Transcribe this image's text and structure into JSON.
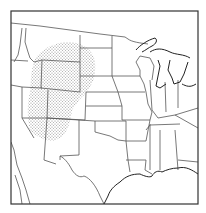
{
  "map": {
    "type": "range-map",
    "region": "Western and Central United States",
    "frame_color": "#333333",
    "line_color": "#555555",
    "stipple_color": "#9a9a9a",
    "background": "#ffffff",
    "shaded_area": "stippled range centered on Wyoming, Colorado, Utah and adjacent states"
  }
}
